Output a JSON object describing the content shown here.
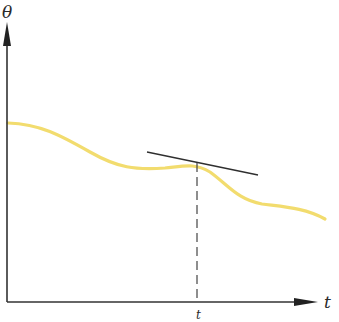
{
  "diagram": {
    "y_axis_label": "θ",
    "x_axis_label": "t",
    "marker_label": "t",
    "colors": {
      "axes": "#333333",
      "curve": "#f2dc6e",
      "tangent": "#2f2f2f",
      "dashed": "#444444",
      "background": "#ffffff"
    },
    "elements": [
      "y-axis with arrow labelled θ",
      "x-axis with arrow labelled t",
      "yellow curve θ(t) decreasing with wiggles",
      "tangent line touching curve at point t",
      "vertical dashed line from tangent point to x-axis",
      "marker label t below x-axis"
    ]
  }
}
